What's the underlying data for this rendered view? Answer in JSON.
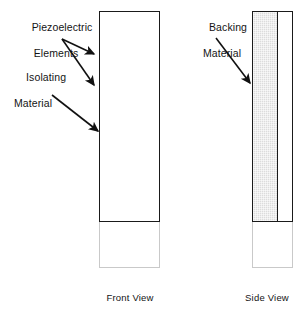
{
  "diagram": {
    "title_absent": true,
    "labels": {
      "piezoelectric": {
        "line1": "Piezoelectric",
        "line2": "Elements"
      },
      "isolating": {
        "line1": "Isolating",
        "line2": "Material"
      },
      "backing": {
        "line1": "Backing",
        "line2": "Material"
      }
    },
    "captions": {
      "front": "Front View",
      "side": "Side View"
    },
    "colors": {
      "piezoelectric_fill": "#3c3c3c",
      "isolating_fill": "#ffffff",
      "backing_fill": "#dcdcdc",
      "outline": "#1a1a1a",
      "text": "#141414",
      "housing_outline": "#c9c9c9"
    },
    "front_view": {
      "name": "Front View",
      "band_count": 21,
      "bands": [
        {
          "material": "piezoelectric"
        },
        {
          "material": "isolating"
        },
        {
          "material": "piezoelectric"
        },
        {
          "material": "isolating"
        },
        {
          "material": "piezoelectric"
        },
        {
          "material": "isolating"
        },
        {
          "material": "piezoelectric"
        },
        {
          "material": "isolating"
        },
        {
          "material": "piezoelectric"
        },
        {
          "material": "isolating"
        },
        {
          "material": "piezoelectric"
        },
        {
          "material": "isolating"
        },
        {
          "material": "piezoelectric"
        },
        {
          "material": "isolating"
        },
        {
          "material": "piezoelectric"
        },
        {
          "material": "isolating"
        },
        {
          "material": "piezoelectric"
        },
        {
          "material": "isolating"
        },
        {
          "material": "piezoelectric"
        },
        {
          "material": "isolating"
        },
        {
          "material": "piezoelectric"
        }
      ]
    },
    "side_view": {
      "name": "Side View",
      "backing_column": {
        "material": "backing"
      },
      "band_count": 21,
      "bands": [
        {
          "material": "piezoelectric"
        },
        {
          "material": "isolating"
        },
        {
          "material": "piezoelectric"
        },
        {
          "material": "isolating"
        },
        {
          "material": "piezoelectric"
        },
        {
          "material": "isolating"
        },
        {
          "material": "piezoelectric"
        },
        {
          "material": "isolating"
        },
        {
          "material": "piezoelectric"
        },
        {
          "material": "isolating"
        },
        {
          "material": "piezoelectric"
        },
        {
          "material": "isolating"
        },
        {
          "material": "piezoelectric"
        },
        {
          "material": "isolating"
        },
        {
          "material": "piezoelectric"
        },
        {
          "material": "isolating"
        },
        {
          "material": "piezoelectric"
        },
        {
          "material": "isolating"
        },
        {
          "material": "piezoelectric"
        },
        {
          "material": "isolating"
        },
        {
          "material": "piezoelectric"
        }
      ]
    },
    "annotations": [
      {
        "name": "piezoelectric-arrow-upper",
        "from_label": "piezoelectric",
        "points_to": "front_view_dark_band"
      },
      {
        "name": "piezoelectric-arrow-lower",
        "from_label": "piezoelectric",
        "points_to": "front_view_dark_band"
      },
      {
        "name": "isolating-arrow",
        "from_label": "isolating",
        "points_to": "front_view_white_band"
      },
      {
        "name": "backing-arrow",
        "from_label": "backing",
        "points_to": "side_view_backing_column"
      }
    ]
  }
}
